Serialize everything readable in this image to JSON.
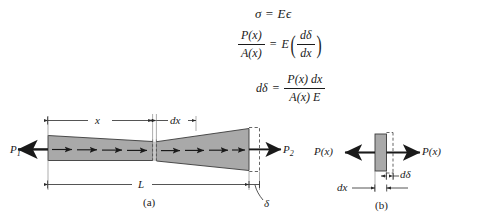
{
  "figure": {
    "type": "mechanics-of-materials-axial-deformation",
    "equations": [
      {
        "id": "eq1",
        "text": "σ = Eϵ",
        "lhs": "σ",
        "rhs": "Eϵ",
        "relation": "="
      },
      {
        "id": "eq2",
        "text": "P(x)/A(x) = E(dδ/dx)",
        "lhs_num": "P(x)",
        "lhs_den": "A(x)",
        "rhs_lead": "E",
        "rhs_num": "dδ",
        "rhs_den": "dx",
        "relation": "=",
        "paren_open": "(",
        "paren_close": ")"
      },
      {
        "id": "eq3",
        "text": "dδ = P(x) dx / A(x) E",
        "lhs": "dδ",
        "relation": "=",
        "rhs_num": "P(x) dx",
        "rhs_den": "A(x) E"
      }
    ],
    "panel_a": {
      "caption": "(a)",
      "force_left_label": "P",
      "force_left_sub": "1",
      "force_right_label": "P",
      "force_right_sub": "2",
      "dim_x_label": "x",
      "dim_dx_label": "dx",
      "dim_L_label": "L",
      "elongation_label": "δ",
      "internal_arrow_count_left": 4,
      "internal_arrow_count_right": 5,
      "bar_fill": "#a9a9a9",
      "bar_stroke": "#3a3a3a",
      "dashed_stroke": "#4a4a4a"
    },
    "panel_b": {
      "caption": "(b)",
      "force_left_label": "P(x)",
      "force_right_label": "P(x)",
      "dim_dx_label": "dx",
      "dim_ddelta_label": "dδ",
      "element_fill": "#a9a9a9",
      "element_stroke": "#3a3a3a"
    },
    "colors": {
      "ink": "#1a1a1a",
      "gray_fill": "#a9a9a9",
      "light_gray": "#c9c9c9",
      "background": "#ffffff"
    }
  }
}
